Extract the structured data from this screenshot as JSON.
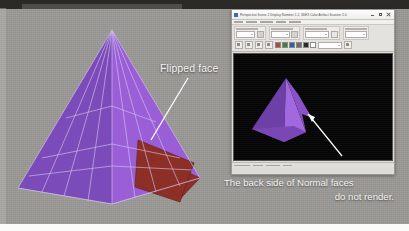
{
  "slide": {
    "background_color": "#9b9a96",
    "top_band_color": "#2c2a27"
  },
  "annotations": {
    "flipped_face_label": "Flipped face",
    "caption_line1": "The back side of Normal faces",
    "caption_line2": "do not render.",
    "leader_line_color": "#ffffff"
  },
  "pyramid": {
    "left_face_color": "#7b4cb9",
    "right_face_color": "#9a5fd6",
    "front_left_color": "#8a54c7",
    "wire_color": "#d9c9f2",
    "flipped_face_color": "#8c2f27",
    "flipped_face_edge": "#5e1d18"
  },
  "app_window": {
    "title": "Perspective Scene 2 Display Rammer 1.2, 3DEX Color Artifact Scanner 2.0",
    "titlebar_icon": "app-icon",
    "window_buttons": [
      {
        "name": "minimize-button",
        "glyph": "minimize-icon"
      },
      {
        "name": "maximize-button",
        "glyph": "maximize-icon"
      },
      {
        "name": "close-button",
        "glyph": "close-icon"
      }
    ],
    "toolbar": {
      "groups": [
        {
          "name": "display-mode-group",
          "combo_count": 1,
          "button_count": 2
        },
        {
          "name": "material-group",
          "combo_count": 1,
          "button_count": 2
        },
        {
          "name": "shading-group",
          "combo_count": 1,
          "button_count": 1
        },
        {
          "name": "render-group",
          "combo_count": 1,
          "button_count": 1
        }
      ],
      "swatches": [
        "#b14a3e",
        "#3f7f46",
        "#2f5fa8",
        "#6d6b67",
        "#2b2b2b",
        "#ffffff"
      ]
    },
    "viewport": {
      "background_color": "#070607",
      "model_color": "#8a52c6",
      "model_color_light": "#a169dd",
      "model_color_dark": "#6f3fa8",
      "arrow_color": "#ffffff"
    },
    "statusbar": {
      "segments": 4
    }
  }
}
